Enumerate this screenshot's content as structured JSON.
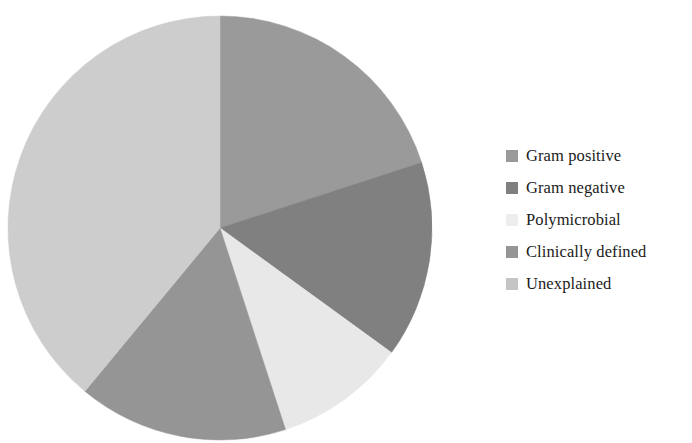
{
  "chart_data": {
    "type": "pie",
    "title": "",
    "subtitle": "",
    "xlabel": "",
    "ylabel": "",
    "grid": false,
    "legend_position": "right",
    "start_angle_deg": 0,
    "direction": "clockwise",
    "categories": [
      "Gram positive",
      "Gram negative",
      "Polymicrobial",
      "Clinically defined",
      "Unexplained"
    ],
    "values": [
      20,
      15,
      10,
      16,
      39
    ],
    "unit": "percent",
    "slices": [
      {
        "label": "Gram positive",
        "value": 20,
        "color": "#9a9a9a",
        "start_deg": 0,
        "end_deg": 72
      },
      {
        "label": "Gram negative",
        "value": 15,
        "color": "#808080",
        "start_deg": 72,
        "end_deg": 126
      },
      {
        "label": "Polymicrobial",
        "value": 10,
        "color": "#e8e8e8",
        "start_deg": 126,
        "end_deg": 162
      },
      {
        "label": "Clinically defined",
        "value": 16,
        "color": "#959595",
        "start_deg": 162,
        "end_deg": 219.6
      },
      {
        "label": "Unexplained",
        "value": 39,
        "color": "#cdcdcd",
        "start_deg": 219.6,
        "end_deg": 360
      }
    ],
    "geometry": {
      "center_x": 220,
      "center_y": 228,
      "radius": 212
    }
  },
  "legend": {
    "items": [
      {
        "label": "Gram positive",
        "color": "#9a9a9a"
      },
      {
        "label": "Gram negative",
        "color": "#808080"
      },
      {
        "label": "Polymicrobial",
        "color": "#ededed"
      },
      {
        "label": "Clinically defined",
        "color": "#959595"
      },
      {
        "label": "Unexplained",
        "color": "#c4c4c4"
      }
    ]
  },
  "colors": {
    "background": "#ffffff",
    "text": "#1b1b1b",
    "gram_positive": "#9a9a9a",
    "gram_negative": "#808080",
    "polymicrobial": "#e8e8e8",
    "clinically_defined": "#959595",
    "unexplained": "#cdcdcd"
  }
}
